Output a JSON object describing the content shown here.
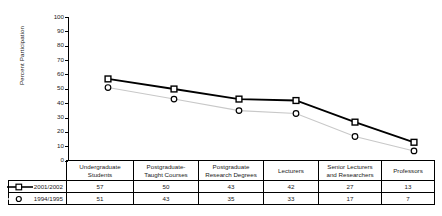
{
  "chart_data": {
    "type": "line",
    "title": "",
    "xlabel": "",
    "ylabel": "Percent Participation",
    "ylim": [
      0,
      100
    ],
    "yticks": [
      0,
      10,
      20,
      30,
      40,
      50,
      60,
      70,
      80,
      90,
      100
    ],
    "grid": false,
    "legend_position": "table-left",
    "categories": [
      "Undergraduate Students",
      "Postgraduate-Taught Courses",
      "Postgraduate Research Degrees",
      "Lecturers",
      "Senior Lecturers and Researchers",
      "Professors"
    ],
    "series": [
      {
        "name": "2001/2002",
        "values": [
          57,
          50,
          43,
          42,
          27,
          13
        ],
        "color": "#000000",
        "marker": "square",
        "line_style": "solid"
      },
      {
        "name": "1994/1995",
        "values": [
          51,
          43,
          35,
          33,
          17,
          7
        ],
        "color": "#c8c8c8",
        "marker": "circle",
        "line_style": "solid-light"
      }
    ]
  },
  "axis": {
    "y_label": "Percent Participation",
    "y_ticks": [
      "100",
      "90",
      "80",
      "70",
      "60",
      "50",
      "40",
      "30",
      "20",
      "10",
      "0"
    ]
  },
  "table": {
    "headers": [
      "Undergraduate Students",
      "Postgraduate-Taught Courses",
      "Postgraduate Research Degrees",
      "Lecturers",
      "Senior Lecturers and Researchers",
      "Professors"
    ],
    "header_lines": [
      [
        "Undergraduate",
        "Students"
      ],
      [
        "Postgraduate-",
        "Taught Courses"
      ],
      [
        "Postgraduate",
        "Research Degrees"
      ],
      [
        "Lecturers",
        ""
      ],
      [
        "Senior Lecturers",
        "and Researchers"
      ],
      [
        "Professors",
        ""
      ]
    ],
    "rows": [
      {
        "legend": "2001/2002",
        "values": [
          "57",
          "50",
          "43",
          "42",
          "27",
          "13"
        ]
      },
      {
        "legend": "1994/1995",
        "values": [
          "51",
          "43",
          "35",
          "33",
          "17",
          "7"
        ]
      }
    ]
  }
}
